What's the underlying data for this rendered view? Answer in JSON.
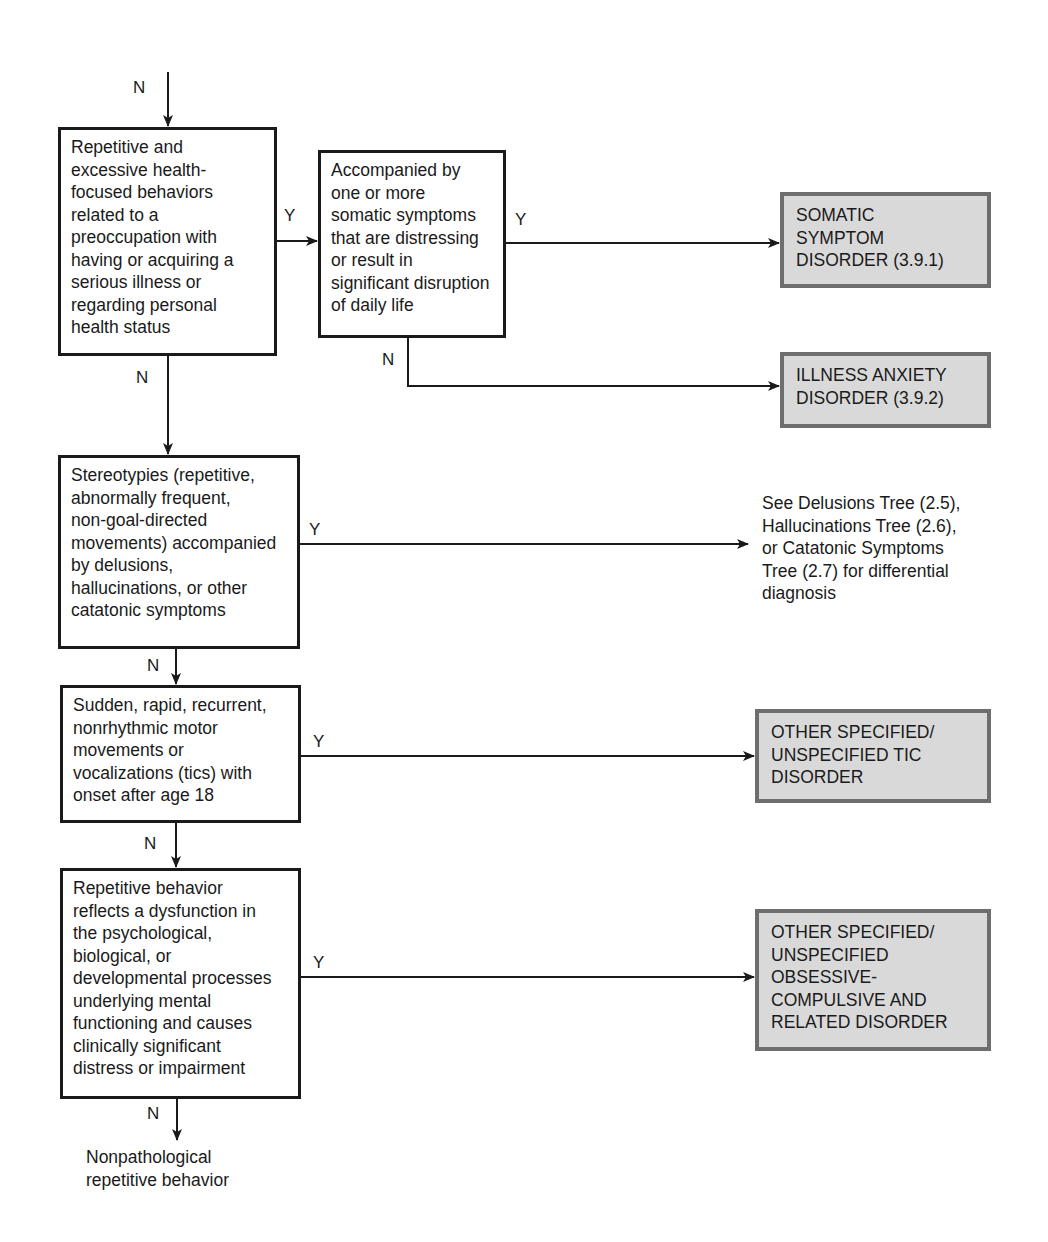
{
  "diagram": {
    "type": "decision-tree",
    "entry_label": "N",
    "nodes": {
      "q1": {
        "text": "Repetitive and\nexcessive health-\nfocused behaviors\nrelated to a\npreoccupation with\nhaving or acquiring a\nserious illness or\nregarding personal\nhealth status"
      },
      "q2": {
        "text": "Accompanied by\none or more\nsomatic symptoms\nthat are distressing\nor result in\nsignificant disruption\nof daily life"
      },
      "q3": {
        "text": "Stereotypies (repetitive,\nabnormally frequent,\nnon-goal-directed\nmovements) accompanied\nby delusions,\nhallucinations, or other\ncatatonic symptoms"
      },
      "q4": {
        "text": "Sudden, rapid, recurrent,\nnonrhythmic motor\nmovements or\nvocalizations (tics) with\nonset after age 18"
      },
      "q5": {
        "text": "Repetitive behavior\nreflects a dysfunction in\nthe psychological,\nbiological, or\ndevelopmental processes\nunderlying mental\nfunctioning and causes\nclinically significant\ndistress or impairment"
      }
    },
    "outcomes": {
      "somatic": {
        "text": "SOMATIC\nSYMPTOM\nDISORDER (3.9.1)"
      },
      "illness_anxiety": {
        "text": "ILLNESS ANXIETY\nDISORDER (3.9.2)"
      },
      "see_trees": {
        "text": "See Delusions Tree (2.5),\nHallucinations Tree (2.6),\nor Catatonic Symptoms\nTree (2.7) for differential\ndiagnosis"
      },
      "tic": {
        "text": "OTHER SPECIFIED/\nUNSPECIFIED TIC\nDISORDER"
      },
      "ocd": {
        "text": "OTHER SPECIFIED/\nUNSPECIFIED\nOBSESSIVE-\nCOMPULSIVE AND\nRELATED DISORDER"
      },
      "nonpathological": {
        "text": "Nonpathological\nrepetitive behavior"
      }
    },
    "edge_labels": {
      "yes": "Y",
      "no": "N"
    },
    "edges": [
      {
        "from": "entry",
        "to": "q1",
        "label": "N"
      },
      {
        "from": "q1",
        "to": "q2",
        "label": "Y"
      },
      {
        "from": "q1",
        "to": "q3",
        "label": "N"
      },
      {
        "from": "q2",
        "to": "somatic",
        "label": "Y"
      },
      {
        "from": "q2",
        "to": "illness_anxiety",
        "label": "N"
      },
      {
        "from": "q3",
        "to": "see_trees",
        "label": "Y"
      },
      {
        "from": "q3",
        "to": "q4",
        "label": "N"
      },
      {
        "from": "q4",
        "to": "tic",
        "label": "Y"
      },
      {
        "from": "q4",
        "to": "q5",
        "label": "N"
      },
      {
        "from": "q5",
        "to": "ocd",
        "label": "Y"
      },
      {
        "from": "q5",
        "to": "nonpathological",
        "label": "N"
      }
    ],
    "colors": {
      "line": "#1a1a1a",
      "outcome_fill": "#d9d9d9",
      "outcome_border": "#6e6e6e"
    }
  }
}
